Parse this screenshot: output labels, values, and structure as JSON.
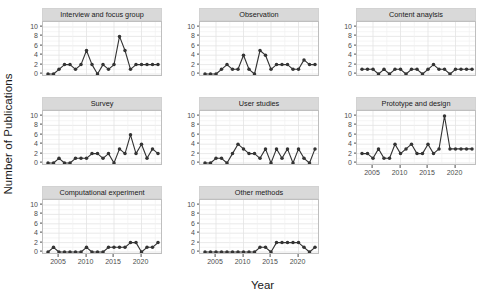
{
  "chart_data": {
    "type": "line",
    "title": "",
    "xlabel": "Year",
    "ylabel": "Number of Publications",
    "xlim": [
      2003,
      2023
    ],
    "ylim": [
      0,
      10
    ],
    "yticks": [
      0,
      2,
      4,
      6,
      8,
      10
    ],
    "xticks": [
      2005,
      2010,
      2015,
      2020
    ],
    "grid": true,
    "legend": "none",
    "marker": "filled-circle",
    "series_color": "#333333",
    "facet_layout": {
      "rows": 3,
      "cols": 3,
      "n_panels": 8
    },
    "x": [
      2003,
      2004,
      2005,
      2006,
      2007,
      2008,
      2009,
      2010,
      2011,
      2012,
      2013,
      2014,
      2015,
      2016,
      2017,
      2018,
      2019,
      2020,
      2021,
      2022,
      2023
    ],
    "series": [
      {
        "name": "Interview and focus group",
        "values": [
          0,
          0,
          1,
          2,
          2,
          1,
          2,
          5,
          2,
          0,
          2,
          1,
          2,
          2,
          5,
          1,
          2,
          2,
          2,
          2,
          2
        ],
        "extra_values": [
          8
        ],
        "peak": 8,
        "peak_year": 2016
      },
      {
        "name": "Observation",
        "values": [
          0,
          0,
          0,
          1,
          2,
          1,
          1,
          4,
          1,
          0,
          5,
          4,
          1,
          2,
          2,
          2,
          1,
          1,
          3,
          2,
          2
        ],
        "peak": 5,
        "peak_year": 2013
      },
      {
        "name": "Content anaylsis",
        "values": [
          1,
          1,
          1,
          0,
          1,
          0,
          1,
          1,
          0,
          1,
          1,
          0,
          1,
          2,
          1,
          1,
          0,
          1,
          1,
          1,
          1
        ],
        "peak": 2,
        "peak_year": 2016
      },
      {
        "name": "Survey",
        "values": [
          0,
          0,
          1,
          0,
          0,
          1,
          1,
          1,
          2,
          2,
          1,
          2,
          0,
          3,
          2,
          6,
          2,
          4,
          1,
          3,
          2
        ],
        "peak": 6,
        "peak_year": 2018
      },
      {
        "name": "User studies",
        "values": [
          0,
          0,
          1,
          1,
          0,
          2,
          4,
          3,
          2,
          2,
          1,
          3,
          0,
          3,
          1,
          3,
          0,
          3,
          1,
          0,
          3
        ],
        "peak": 4,
        "peak_year": 2009
      },
      {
        "name": "Prototype and design",
        "values": [
          2,
          2,
          1,
          3,
          1,
          1,
          4,
          2,
          3,
          4,
          2,
          2,
          4,
          2,
          3,
          10,
          3,
          3,
          3,
          3,
          3
        ],
        "peak": 10,
        "peak_year": 2018
      },
      {
        "name": "Computational experiment",
        "values": [
          0,
          1,
          0,
          0,
          0,
          0,
          0,
          1,
          0,
          0,
          0,
          1,
          1,
          1,
          1,
          2,
          2,
          0,
          1,
          1,
          2
        ],
        "peak": 2,
        "peak_year": 2018
      },
      {
        "name": "Other methods",
        "values": [
          0,
          0,
          0,
          0,
          0,
          0,
          0,
          0,
          0,
          0,
          1,
          1,
          0,
          2,
          2,
          2,
          2,
          2,
          1,
          0,
          1
        ],
        "peak": 2,
        "peak_year": 2016
      }
    ]
  },
  "axis": {
    "ylabel": "Number of Publications",
    "xlabel": "Year",
    "ytick_labels": [
      "0",
      "2",
      "4",
      "6",
      "8",
      "10"
    ],
    "xtick_labels": [
      "2005",
      "2010",
      "2015",
      "2020"
    ]
  },
  "strips": {
    "p0": "Interview and focus group",
    "p1": "Observation",
    "p2": "Content anaylsis",
    "p3": "Survey",
    "p4": "User studies",
    "p5": "Prototype and design",
    "p6": "Computational experiment",
    "p7": "Other methods"
  },
  "style": {
    "strip_fill": "#d9d9d9",
    "panel_fill": "#ffffff",
    "grid_major": "#e3e3e3",
    "grid_minor": "#f0f0f0",
    "point_color": "#333333",
    "line_color": "#333333",
    "axis_text": "#4d4d4d",
    "title_text": "#1a1a1a"
  }
}
